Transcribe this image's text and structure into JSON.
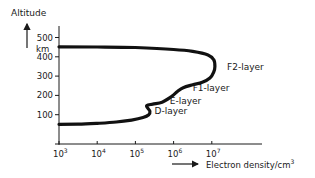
{
  "chart_data": {
    "type": "line",
    "title": "",
    "ylabel": "Altitude",
    "yunit": "km",
    "xlabel": "Electron density/cm",
    "xlabel_superscript": "3",
    "xscale": "log",
    "xlim_exponent": [
      3,
      8.2
    ],
    "ylim": [
      0,
      520
    ],
    "grid": false,
    "x_ticks": [
      {
        "base": "10",
        "exp": "3",
        "value": 1000
      },
      {
        "base": "10",
        "exp": "4",
        "value": 10000
      },
      {
        "base": "10",
        "exp": "5",
        "value": 100000
      },
      {
        "base": "10",
        "exp": "6",
        "value": 1000000
      },
      {
        "base": "10",
        "exp": "7",
        "value": 10000000
      }
    ],
    "y_ticks": [
      {
        "label": "100",
        "value": 100
      },
      {
        "label": "200",
        "value": 200
      },
      {
        "label": "300",
        "value": 300
      },
      {
        "label": "400",
        "value": 400
      },
      {
        "label": "500",
        "value": 500
      }
    ],
    "series": [
      {
        "name": "Electron density profile",
        "points_log10x_alt": [
          [
            3.0,
            50
          ],
          [
            3.5,
            51
          ],
          [
            4.0,
            55
          ],
          [
            4.5,
            62
          ],
          [
            4.9,
            72
          ],
          [
            5.2,
            85
          ],
          [
            5.35,
            100
          ],
          [
            5.38,
            118
          ],
          [
            5.32,
            135
          ],
          [
            5.3,
            148
          ],
          [
            5.45,
            155
          ],
          [
            5.7,
            165
          ],
          [
            5.95,
            195
          ],
          [
            6.1,
            220
          ],
          [
            6.25,
            240
          ],
          [
            6.5,
            255
          ],
          [
            6.75,
            268
          ],
          [
            6.95,
            290
          ],
          [
            7.05,
            320
          ],
          [
            7.08,
            350
          ],
          [
            7.05,
            385
          ],
          [
            6.9,
            410
          ],
          [
            6.5,
            428
          ],
          [
            6.0,
            438
          ],
          [
            5.0,
            448
          ],
          [
            4.0,
            451
          ],
          [
            3.0,
            452
          ]
        ]
      }
    ],
    "annotations": [
      {
        "text": "F2-layer",
        "at_log10x": 7.4,
        "at_alt": 345
      },
      {
        "text": "F1-layer",
        "at_log10x": 6.5,
        "at_alt": 240
      },
      {
        "text": "E-layer",
        "at_log10x": 5.9,
        "at_alt": 170
      },
      {
        "text": "D-layer",
        "at_log10x": 5.5,
        "at_alt": 118
      }
    ]
  }
}
